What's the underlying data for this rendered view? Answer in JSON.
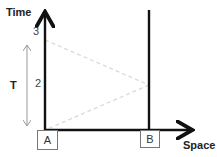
{
  "diagram": {
    "axes": {
      "y_label": "Time",
      "x_label": "Space"
    },
    "ticks": [
      {
        "label": "3"
      },
      {
        "label": "2"
      }
    ],
    "interval_label": "T",
    "worldlines": [
      {
        "label": "A"
      },
      {
        "label": "B"
      }
    ],
    "colors": {
      "axis": "#111111",
      "dashed": "#d8d8d8",
      "interval_arrow": "#999999"
    }
  }
}
